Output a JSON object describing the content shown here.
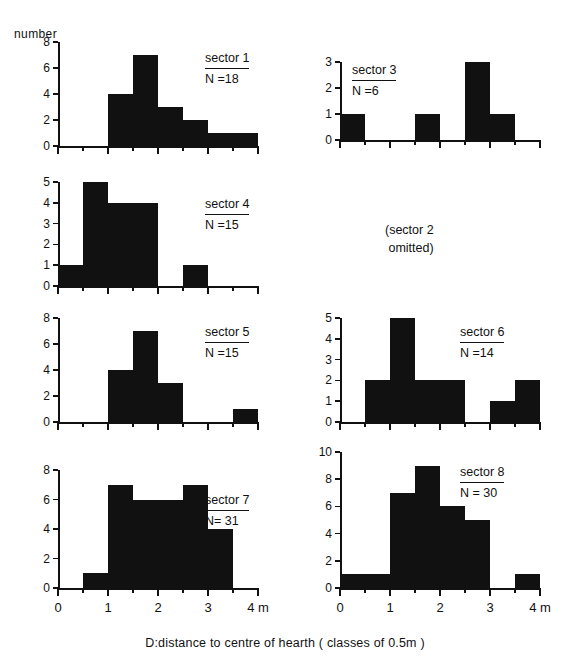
{
  "figure": {
    "ylabel": "number",
    "caption": "D:distance to centre of hearth ( classes of 0.5m )",
    "omitted_note": "(sector 2\n omitted)",
    "axis_unit_label": "4 m"
  },
  "chart_data": [
    {
      "type": "bar",
      "title": "sector 1",
      "annotation": "N =18",
      "xlabel": "D:distance to centre of hearth ( classes of 0.5m )",
      "ylabel": "number",
      "xlim": [
        0,
        4
      ],
      "ylim": [
        0,
        8
      ],
      "yticks": [
        0,
        2,
        4,
        6,
        8
      ],
      "xticks": [
        0,
        0.5,
        1,
        1.5,
        2,
        2.5,
        3,
        3.5,
        4
      ],
      "bin_width": 0.5,
      "bin_starts": [
        0,
        0.5,
        1,
        1.5,
        2,
        2.5,
        3,
        3.5
      ],
      "values": [
        0,
        0,
        4,
        7,
        3,
        2,
        1,
        1
      ],
      "n_total": 18,
      "grid": false
    },
    {
      "type": "bar",
      "title": "sector 3",
      "annotation": "N =6",
      "xlabel": "D:distance to centre of hearth ( classes of 0.5m )",
      "ylabel": "number",
      "xlim": [
        0,
        4
      ],
      "ylim": [
        0,
        3
      ],
      "yticks": [
        0,
        1,
        2,
        3
      ],
      "xticks": [
        0,
        0.5,
        1,
        1.5,
        2,
        2.5,
        3,
        3.5,
        4
      ],
      "bin_width": 0.5,
      "bin_starts": [
        0,
        0.5,
        1,
        1.5,
        2,
        2.5,
        3,
        3.5
      ],
      "values": [
        1,
        0,
        0,
        1,
        0,
        3,
        1,
        0
      ],
      "n_total": 6,
      "grid": false
    },
    {
      "type": "bar",
      "title": "sector 4",
      "annotation": "N =15",
      "xlabel": "D:distance to centre of hearth ( classes of 0.5m )",
      "ylabel": "number",
      "xlim": [
        0,
        4
      ],
      "ylim": [
        0,
        5
      ],
      "yticks": [
        0,
        1,
        2,
        3,
        4,
        5
      ],
      "xticks": [
        0,
        0.5,
        1,
        1.5,
        2,
        2.5,
        3,
        3.5,
        4
      ],
      "bin_width": 0.5,
      "bin_starts": [
        0,
        0.5,
        1,
        1.5,
        2,
        2.5,
        3,
        3.5
      ],
      "values": [
        1,
        5,
        4,
        4,
        0,
        1,
        0,
        0
      ],
      "n_total": 15,
      "grid": false
    },
    {
      "type": "bar",
      "title": "sector 5",
      "annotation": "N =15",
      "xlabel": "D:distance to centre of hearth ( classes of 0.5m )",
      "ylabel": "number",
      "xlim": [
        0,
        4
      ],
      "ylim": [
        0,
        8
      ],
      "yticks": [
        0,
        2,
        4,
        6,
        8
      ],
      "xticks": [
        0,
        0.5,
        1,
        1.5,
        2,
        2.5,
        3,
        3.5,
        4
      ],
      "bin_width": 0.5,
      "bin_starts": [
        0,
        0.5,
        1,
        1.5,
        2,
        2.5,
        3,
        3.5
      ],
      "values": [
        0,
        0,
        4,
        7,
        3,
        0,
        0,
        1
      ],
      "n_total": 15,
      "grid": false
    },
    {
      "type": "bar",
      "title": "sector 6",
      "annotation": "N =14",
      "xlabel": "D:distance to centre of hearth ( classes of 0.5m )",
      "ylabel": "number",
      "xlim": [
        0,
        4
      ],
      "ylim": [
        0,
        5
      ],
      "yticks": [
        0,
        1,
        2,
        3,
        4,
        5
      ],
      "xticks": [
        0,
        0.5,
        1,
        1.5,
        2,
        2.5,
        3,
        3.5,
        4
      ],
      "bin_width": 0.5,
      "bin_starts": [
        0,
        0.5,
        1,
        1.5,
        2,
        2.5,
        3,
        3.5
      ],
      "values": [
        0,
        2,
        5,
        2,
        2,
        0,
        1,
        2
      ],
      "n_total": 14,
      "grid": false
    },
    {
      "type": "bar",
      "title": "sector 7",
      "annotation": "N= 31",
      "xlabel": "D:distance to centre of hearth ( classes of 0.5m )",
      "ylabel": "number",
      "xlim": [
        0,
        4
      ],
      "ylim": [
        0,
        8
      ],
      "yticks": [
        0,
        2,
        4,
        6,
        8
      ],
      "xticks": [
        0,
        0.5,
        1,
        1.5,
        2,
        2.5,
        3,
        3.5,
        4
      ],
      "xticklabels": [
        "0",
        "",
        "1",
        "",
        "2",
        "",
        "3",
        "",
        "4 m"
      ],
      "bin_width": 0.5,
      "bin_starts": [
        0,
        0.5,
        1,
        1.5,
        2,
        2.5,
        3,
        3.5
      ],
      "values": [
        0,
        1,
        7,
        6,
        6,
        7,
        4,
        0
      ],
      "n_total": 31,
      "grid": false
    },
    {
      "type": "bar",
      "title": "sector 8",
      "annotation": "N = 30",
      "xlabel": "D:distance to centre of hearth ( classes of 0.5m )",
      "ylabel": "number",
      "xlim": [
        0,
        4
      ],
      "ylim": [
        0,
        10
      ],
      "yticks": [
        0,
        2,
        4,
        6,
        8,
        10
      ],
      "xticks": [
        0,
        0.5,
        1,
        1.5,
        2,
        2.5,
        3,
        3.5,
        4
      ],
      "xticklabels": [
        "0",
        "",
        "1",
        "",
        "2",
        "",
        "3",
        "",
        "4 m"
      ],
      "bin_width": 0.5,
      "bin_starts": [
        0,
        0.5,
        1,
        1.5,
        2,
        2.5,
        3,
        3.5
      ],
      "values": [
        1,
        1,
        7,
        9,
        6,
        5,
        0,
        1
      ],
      "n_total": 30,
      "grid": false
    }
  ],
  "panels": [
    {
      "key": "sector1",
      "chart_index": 0,
      "left": 58,
      "top": 42,
      "width": 200,
      "height": 104,
      "tag_left": 205,
      "tag_top": 50
    },
    {
      "key": "sector3",
      "chart_index": 1,
      "left": 340,
      "top": 62,
      "width": 200,
      "height": 78,
      "tag_left": 352,
      "tag_top": 62
    },
    {
      "key": "sector4",
      "chart_index": 2,
      "left": 58,
      "top": 182,
      "width": 200,
      "height": 104,
      "tag_left": 205,
      "tag_top": 196
    },
    {
      "key": "sector5",
      "chart_index": 3,
      "left": 58,
      "top": 318,
      "width": 200,
      "height": 104,
      "tag_left": 205,
      "tag_top": 324
    },
    {
      "key": "sector6",
      "chart_index": 4,
      "left": 340,
      "top": 318,
      "width": 200,
      "height": 104,
      "tag_left": 460,
      "tag_top": 324
    },
    {
      "key": "sector7",
      "chart_index": 5,
      "left": 58,
      "top": 470,
      "width": 200,
      "height": 118,
      "tag_left": 205,
      "tag_top": 492
    },
    {
      "key": "sector8",
      "chart_index": 6,
      "left": 340,
      "top": 452,
      "width": 200,
      "height": 136,
      "tag_left": 460,
      "tag_top": 464
    }
  ],
  "omitted_panel": {
    "left": 385,
    "top": 222
  },
  "colors": {
    "ink": "#111111",
    "background": "#ffffff",
    "bar_fill": "#111111"
  }
}
